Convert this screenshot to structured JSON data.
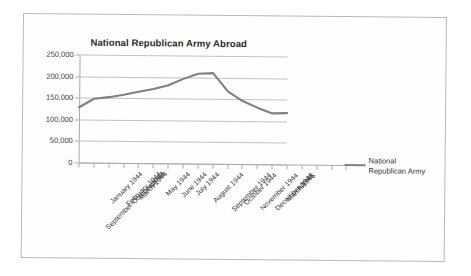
{
  "chart_data": {
    "type": "line",
    "title": "National Republican Army Abroad",
    "xlabel": "",
    "ylabel": "",
    "grid": true,
    "legend_position": "right",
    "ylim": [
      0,
      250000
    ],
    "yticks": [
      0,
      50000,
      100000,
      150000,
      200000,
      250000
    ],
    "ytick_labels": [
      "0",
      "50,000",
      "100,000",
      "150,000",
      "200,000",
      "250,000"
    ],
    "categories": [
      "September-October 1943",
      "January 1944",
      "February 1944",
      "March 1944",
      "apr-44",
      "May 1944",
      "June 1944",
      "July 1944",
      "August 1944",
      "September 1944",
      "October 1944",
      "November 1944",
      "December 1944",
      "March 1945",
      "apr-45"
    ],
    "series": [
      {
        "name": "National Republican Army",
        "color": "#808080",
        "values": [
          128000,
          148000,
          152000,
          158000,
          165000,
          172000,
          181000,
          196000,
          208000,
          210000,
          168000,
          146000,
          131000,
          118000,
          119000
        ]
      }
    ]
  },
  "legend": {
    "entries": [
      {
        "label_line1": "National",
        "label_line2": "Republican Army",
        "color": "#808080"
      }
    ]
  }
}
